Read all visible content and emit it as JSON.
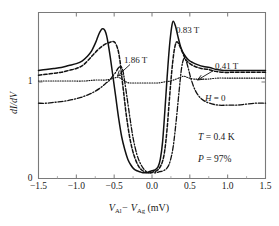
{
  "figure": {
    "background": "#ffffff",
    "line_color": "#111111",
    "axis_color": "#7a7a7a"
  },
  "axis": {
    "ylabel": "dI/dV",
    "xlabel_main": "V",
    "xlabel_sub1": "Al",
    "xlabel_dash": "− V",
    "xlabel_sub2": "Ag",
    "xlabel_unit": " (mV)",
    "xticks": [
      "−1.5",
      "−1.0",
      "−0.5",
      "0.0",
      "0.5",
      "1.0",
      "1.5"
    ],
    "yticks": [
      "0",
      "1"
    ]
  },
  "annotations": {
    "field_083": "0.83 T",
    "field_041": "0.41 T",
    "field_186": "1.86 T",
    "field_zero_italic": "H",
    "field_zero_rest": " = 0",
    "temperature_italic": "T",
    "temperature_rest": " = 0.4 K",
    "polarization_italic": "P",
    "polarization_rest": " = 97%"
  },
  "chart_data": {
    "type": "line",
    "title": "",
    "xlabel": "V_Al - V_Ag (mV)",
    "ylabel": "dI/dV",
    "xlim": [
      -1.5,
      1.5
    ],
    "ylim": [
      0,
      1.72
    ],
    "xticks": [
      -1.5,
      -1.0,
      -0.5,
      0.0,
      0.5,
      1.0,
      1.5
    ],
    "yticks": [
      0,
      1
    ],
    "grid": false,
    "legend_position": "inline-annotations",
    "annotations": [
      {
        "text": "0.83 T",
        "x": 0.46,
        "y": 1.6,
        "series": "0.83 T"
      },
      {
        "text": "0.41 T",
        "x": 1.02,
        "y": 1.32,
        "series": "0.41 T",
        "arrow_to": [
          0.76,
          1.17
        ]
      },
      {
        "text": "1.86 T",
        "x": -0.34,
        "y": 1.28,
        "series": "1.86 T",
        "arrow_to": [
          -0.19,
          1.03
        ]
      },
      {
        "text": "H = 0",
        "x": 0.86,
        "y": 0.88,
        "series": "H = 0"
      },
      {
        "text": "T = 0.4 K",
        "x": 0.78,
        "y": 0.58
      },
      {
        "text": "P = 97%",
        "x": 0.78,
        "y": 0.42
      }
    ],
    "series": [
      {
        "name": "0.41 T",
        "style": "solid",
        "x": [
          -1.5,
          -1.4,
          -1.3,
          -1.2,
          -1.1,
          -1.0,
          -0.92,
          -0.85,
          -0.8,
          -0.75,
          -0.72,
          -0.7,
          -0.68,
          -0.66,
          -0.64,
          -0.62,
          -0.6,
          -0.58,
          -0.55,
          -0.52,
          -0.48,
          -0.44,
          -0.4,
          -0.36,
          -0.32,
          -0.28,
          -0.24,
          -0.2,
          -0.16,
          -0.12,
          -0.08,
          -0.04,
          0.0,
          0.04,
          0.08,
          0.11,
          0.14,
          0.17,
          0.2,
          0.23,
          0.26,
          0.28,
          0.31,
          0.34,
          0.38,
          0.42,
          0.48,
          0.54,
          0.6,
          0.68,
          0.76,
          0.85,
          0.95,
          1.05,
          1.15,
          1.25,
          1.35,
          1.45,
          1.5
        ],
        "y": [
          1.12,
          1.13,
          1.14,
          1.15,
          1.17,
          1.19,
          1.22,
          1.27,
          1.32,
          1.4,
          1.46,
          1.5,
          1.53,
          1.55,
          1.55,
          1.53,
          1.48,
          1.4,
          1.25,
          1.08,
          0.85,
          0.62,
          0.43,
          0.3,
          0.2,
          0.14,
          0.1,
          0.08,
          0.07,
          0.06,
          0.06,
          0.07,
          0.08,
          0.09,
          0.12,
          0.2,
          0.38,
          0.7,
          1.05,
          1.36,
          1.57,
          1.63,
          1.58,
          1.48,
          1.36,
          1.29,
          1.23,
          1.2,
          1.18,
          1.16,
          1.15,
          1.13,
          1.12,
          1.12,
          1.12,
          1.12,
          1.12,
          1.12,
          1.12
        ]
      },
      {
        "name": "0.83 T",
        "style": "dashed",
        "x": [
          -1.5,
          -1.4,
          -1.3,
          -1.2,
          -1.1,
          -1.0,
          -0.92,
          -0.85,
          -0.78,
          -0.72,
          -0.66,
          -0.6,
          -0.56,
          -0.52,
          -0.49,
          -0.46,
          -0.44,
          -0.42,
          -0.4,
          -0.37,
          -0.34,
          -0.3,
          -0.26,
          -0.22,
          -0.18,
          -0.14,
          -0.1,
          -0.06,
          -0.02,
          0.02,
          0.06,
          0.1,
          0.14,
          0.17,
          0.2,
          0.23,
          0.26,
          0.29,
          0.32,
          0.35,
          0.39,
          0.44,
          0.5,
          0.57,
          0.65,
          0.74,
          0.84,
          0.95,
          1.06,
          1.18,
          1.3,
          1.42,
          1.5
        ],
        "y": [
          1.07,
          1.08,
          1.09,
          1.1,
          1.12,
          1.14,
          1.17,
          1.22,
          1.28,
          1.33,
          1.37,
          1.4,
          1.41,
          1.42,
          1.41,
          1.36,
          1.3,
          1.2,
          1.06,
          0.86,
          0.66,
          0.45,
          0.3,
          0.2,
          0.13,
          0.09,
          0.07,
          0.06,
          0.06,
          0.07,
          0.08,
          0.11,
          0.18,
          0.3,
          0.52,
          0.82,
          1.1,
          1.31,
          1.41,
          1.4,
          1.33,
          1.24,
          1.19,
          1.16,
          1.14,
          1.13,
          1.11,
          1.1,
          1.1,
          1.1,
          1.1,
          1.1,
          1.1
        ]
      },
      {
        "name": "1.86 T",
        "style": "dotted",
        "x": [
          -1.5,
          -1.3,
          -1.1,
          -0.9,
          -0.75,
          -0.62,
          -0.55,
          -0.5,
          -0.46,
          -0.42,
          -0.38,
          -0.34,
          -0.3,
          -0.25,
          -0.2,
          -0.14,
          -0.08,
          0.0,
          0.08,
          0.16,
          0.24,
          0.32,
          0.38,
          0.42,
          0.46,
          0.5,
          0.56,
          0.64,
          0.74,
          0.86,
          1.0,
          1.15,
          1.3,
          1.42,
          1.5
        ],
        "y": [
          1.01,
          1.01,
          1.01,
          1.01,
          1.02,
          1.02,
          1.03,
          1.04,
          1.05,
          1.04,
          1.02,
          1.0,
          0.99,
          0.99,
          0.99,
          0.99,
          0.99,
          0.99,
          0.99,
          1.0,
          1.01,
          1.03,
          1.05,
          1.06,
          1.05,
          1.04,
          1.03,
          1.03,
          1.03,
          1.04,
          1.04,
          1.04,
          1.04,
          1.04,
          1.04
        ]
      },
      {
        "name": "H = 0",
        "style": "dashdot",
        "x": [
          -1.5,
          -1.4,
          -1.28,
          -1.16,
          -1.04,
          -0.94,
          -0.84,
          -0.76,
          -0.68,
          -0.62,
          -0.56,
          -0.52,
          -0.48,
          -0.45,
          -0.42,
          -0.4,
          -0.38,
          -0.36,
          -0.33,
          -0.29,
          -0.25,
          -0.2,
          -0.15,
          -0.1,
          -0.05,
          0.0,
          0.05,
          0.1,
          0.15,
          0.2,
          0.24,
          0.28,
          0.32,
          0.36,
          0.39,
          0.42,
          0.45,
          0.48,
          0.52,
          0.58,
          0.66,
          0.76,
          0.88,
          1.0,
          1.12,
          1.24,
          1.36,
          1.46,
          1.5
        ],
        "y": [
          0.78,
          0.78,
          0.79,
          0.8,
          0.82,
          0.84,
          0.87,
          0.9,
          0.94,
          0.98,
          1.02,
          1.06,
          1.1,
          1.14,
          1.16,
          1.15,
          1.1,
          1.0,
          0.84,
          0.62,
          0.42,
          0.25,
          0.15,
          0.09,
          0.06,
          0.06,
          0.06,
          0.07,
          0.08,
          0.11,
          0.18,
          0.33,
          0.6,
          0.92,
          1.14,
          1.24,
          1.22,
          1.14,
          1.02,
          0.9,
          0.82,
          0.78,
          0.76,
          0.76,
          0.76,
          0.77,
          0.78,
          0.78,
          0.78
        ]
      }
    ]
  }
}
